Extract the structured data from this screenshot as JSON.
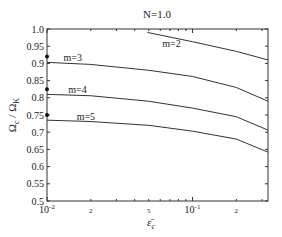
{
  "chart_data": {
    "type": "line",
    "title": "N=1.0",
    "xlabel": "ε̄_c",
    "ylabel": "Ω_c / Ω_K",
    "xscale": "log",
    "xlim": [
      0.01,
      0.33
    ],
    "ylim": [
      0.5,
      1.0
    ],
    "grid": false,
    "yticks": [
      "0.5",
      "0.55",
      "0.6",
      "0.65",
      "0.7",
      "0.75",
      "0.8",
      "0.85",
      "0.9",
      "0.95",
      "1.0"
    ],
    "xtick_labels": [
      {
        "value": 0.01,
        "label": "10",
        "sup": "-2"
      },
      {
        "value": 0.02,
        "label": "2",
        "sup": ""
      },
      {
        "value": 0.05,
        "label": "5",
        "sup": ""
      },
      {
        "value": 0.1,
        "label": "10",
        "sup": "-1"
      },
      {
        "value": 0.2,
        "label": "2",
        "sup": ""
      }
    ],
    "series": [
      {
        "name": "m=2",
        "x": [
          0.049,
          0.1,
          0.2,
          0.33
        ],
        "y": [
          0.99,
          0.963,
          0.935,
          0.91
        ]
      },
      {
        "name": "m=3",
        "x": [
          0.01,
          0.02,
          0.05,
          0.1,
          0.2,
          0.33
        ],
        "y": [
          0.903,
          0.897,
          0.88,
          0.862,
          0.83,
          0.79
        ]
      },
      {
        "name": "m=4",
        "x": [
          0.01,
          0.02,
          0.05,
          0.1,
          0.2,
          0.33
        ],
        "y": [
          0.81,
          0.806,
          0.79,
          0.77,
          0.745,
          0.706
        ]
      },
      {
        "name": "m=5",
        "x": [
          0.01,
          0.02,
          0.05,
          0.1,
          0.2,
          0.33
        ],
        "y": [
          0.735,
          0.731,
          0.72,
          0.703,
          0.68,
          0.642
        ]
      }
    ],
    "markers": [
      {
        "x": 0.01,
        "y": 0.92
      },
      {
        "x": 0.01,
        "y": 0.825
      },
      {
        "x": 0.01,
        "y": 0.75
      }
    ],
    "annotations": [
      {
        "text": "m=2",
        "x": 0.062,
        "y": 0.955
      },
      {
        "text": "m=3",
        "x": 0.013,
        "y": 0.915
      },
      {
        "text": "m=4",
        "x": 0.014,
        "y": 0.822
      },
      {
        "text": "m=5",
        "x": 0.016,
        "y": 0.745
      }
    ]
  }
}
